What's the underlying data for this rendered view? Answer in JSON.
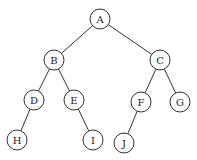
{
  "diagram": {
    "type": "binary-tree",
    "nodes": [
      {
        "id": "A",
        "label": "A",
        "x": 100,
        "y": 19
      },
      {
        "id": "B",
        "label": "B",
        "x": 54,
        "y": 60
      },
      {
        "id": "C",
        "label": "C",
        "x": 160,
        "y": 60
      },
      {
        "id": "D",
        "label": "D",
        "x": 34,
        "y": 100
      },
      {
        "id": "E",
        "label": "E",
        "x": 74,
        "y": 100
      },
      {
        "id": "F",
        "label": "F",
        "x": 141,
        "y": 102
      },
      {
        "id": "G",
        "label": "G",
        "x": 180,
        "y": 102
      },
      {
        "id": "H",
        "label": "H",
        "x": 17,
        "y": 140
      },
      {
        "id": "I",
        "label": "I",
        "x": 93,
        "y": 140
      },
      {
        "id": "J",
        "label": "J",
        "x": 124,
        "y": 143
      }
    ],
    "edges": [
      {
        "from": "A",
        "to": "B"
      },
      {
        "from": "A",
        "to": "C"
      },
      {
        "from": "B",
        "to": "D"
      },
      {
        "from": "B",
        "to": "E"
      },
      {
        "from": "C",
        "to": "F"
      },
      {
        "from": "C",
        "to": "G"
      },
      {
        "from": "D",
        "to": "H"
      },
      {
        "from": "E",
        "to": "I"
      },
      {
        "from": "F",
        "to": "J"
      }
    ],
    "node_radius": 10
  }
}
